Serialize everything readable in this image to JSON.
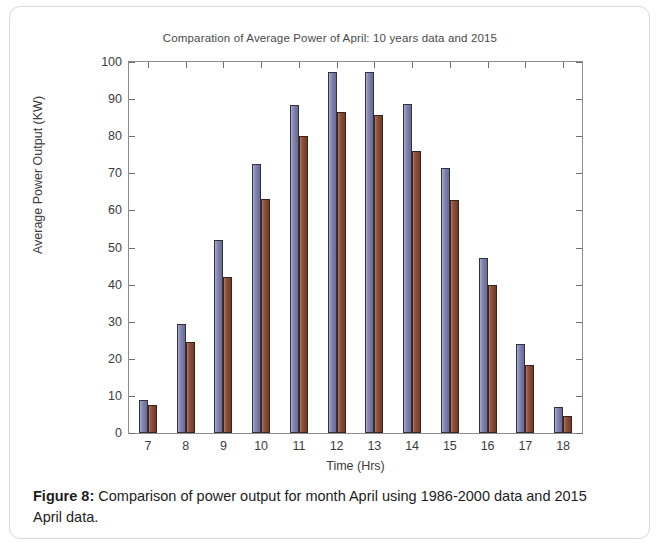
{
  "figure": {
    "caption_label": "Figure 8:",
    "caption_text": " Comparison of power output for month April using 1986-2000 data and 2015 April data."
  },
  "chart_data": {
    "type": "bar",
    "title": "Comparation of Average Power of April: 10 years data and 2015",
    "xlabel": "Time (Hrs)",
    "ylabel": "Average Power Output (KW)",
    "categories": [
      "7",
      "8",
      "9",
      "10",
      "11",
      "12",
      "13",
      "14",
      "15",
      "16",
      "17",
      "18"
    ],
    "series": [
      {
        "name": "10 years data (1986-2000)",
        "color": "#7d80b0",
        "values": [
          9,
          29.5,
          52,
          72.5,
          88.5,
          97.3,
          97.3,
          88.8,
          71.3,
          47.2,
          24,
          7
        ]
      },
      {
        "name": "2015 April data",
        "color": "#8b4a33",
        "values": [
          7.5,
          24.5,
          42,
          63,
          80,
          86.5,
          85.7,
          76,
          62.8,
          40,
          18.4,
          4.5
        ]
      }
    ],
    "ylim": [
      0,
      100
    ],
    "yticks": [
      0,
      10,
      20,
      30,
      40,
      50,
      60,
      70,
      80,
      90,
      100
    ],
    "ytick_labels": [
      "0",
      "10",
      "20",
      "30",
      "40",
      "50",
      "60",
      "70",
      "80",
      "90",
      "100"
    ],
    "grid": false,
    "legend": "none"
  }
}
